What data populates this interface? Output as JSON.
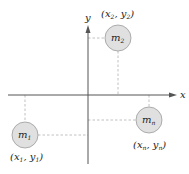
{
  "diagram": {
    "axes": {
      "x_label": "x",
      "y_label": "y",
      "color": "#555555"
    },
    "masses": [
      {
        "id": "m2",
        "label_base": "m",
        "label_sub": "2",
        "coord_label": {
          "x_base": "x",
          "x_sub": "2",
          "y_base": "y",
          "y_sub": "2"
        },
        "quadrant": "upper-right"
      },
      {
        "id": "m1",
        "label_base": "m",
        "label_sub": "1",
        "coord_label": {
          "x_base": "x",
          "x_sub": "1",
          "y_base": "y",
          "y_sub": "1"
        },
        "quadrant": "lower-left"
      },
      {
        "id": "mn",
        "label_base": "m",
        "label_sub": "n",
        "coord_label": {
          "x_base": "x",
          "x_sub": "n",
          "y_base": "y",
          "y_sub": "n"
        },
        "quadrant": "lower-right"
      }
    ],
    "colors": {
      "mass_fill": "#e0e0e0",
      "mass_stroke": "#9a9a9a",
      "dash": "#b0b0b0"
    },
    "punct": {
      "open": "(",
      "comma": ", ",
      "close": ")"
    }
  }
}
